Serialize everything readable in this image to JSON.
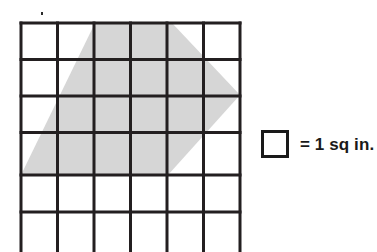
{
  "figure": {
    "title": "",
    "type": "area-on-grid-diagram",
    "grid": {
      "columns": 6,
      "rows": 6,
      "origin_x": 21,
      "origin_y": 23,
      "cell_size": 36.5,
      "line_color": "#231f20",
      "line_width": 3,
      "fill_color": "#ffffff",
      "bottom_row_clipped": true
    },
    "shaded_shape": {
      "name": "shaded-polygon",
      "fill_color": "#d6d6d6",
      "vertices": [
        [
          95,
          23
        ],
        [
          172,
          23
        ],
        [
          240,
          95
        ],
        [
          168,
          175
        ],
        [
          21,
          175
        ]
      ],
      "points_attr": "95,23 172,23 240,95 168,175 21,175"
    },
    "artifact": {
      "name": "stray-dot",
      "x": 41,
      "y": 12,
      "color": "#2b2b2b"
    }
  },
  "legend": {
    "swatch_label": "unit-square-swatch",
    "swatch_fill": "#ffffff",
    "swatch_border": "#1a1a1a",
    "text": "= 1 sq in."
  }
}
